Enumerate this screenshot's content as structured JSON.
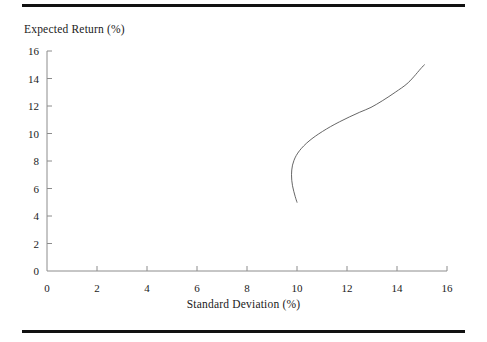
{
  "figure": {
    "background": "#ffffff",
    "rule_color": "#111111",
    "axis_color": "#8c8c8c",
    "curve_color": "#555555"
  },
  "chart_data": {
    "type": "line",
    "title": "",
    "xlabel": "Standard Deviation (%)",
    "ylabel": "Expected Return (%)",
    "xlim": [
      0,
      16
    ],
    "ylim": [
      0,
      16
    ],
    "xticks": [
      0,
      2,
      4,
      6,
      8,
      10,
      12,
      14,
      16
    ],
    "yticks": [
      0,
      2,
      4,
      6,
      8,
      10,
      12,
      14,
      16
    ],
    "xtick_labels": [
      "0",
      "2",
      "4",
      "6",
      "8",
      "10",
      "12",
      "14",
      "16"
    ],
    "ytick_labels": [
      "0",
      "2",
      "4",
      "6",
      "8",
      "10",
      "12",
      "14",
      "16"
    ],
    "grid": false,
    "legend": null,
    "series": [
      {
        "name": "Efficient frontier",
        "color": "#555555",
        "line_width": 0.9,
        "x": [
          10.0,
          9.93,
          9.87,
          9.82,
          9.79,
          9.78,
          9.79,
          9.82,
          9.88,
          9.97,
          10.1,
          10.27,
          10.48,
          10.73,
          11.02,
          11.34,
          11.7,
          12.09,
          12.51,
          12.96,
          13.43,
          13.93,
          14.45,
          14.99,
          15.1
        ],
        "y": [
          5.0,
          5.4,
          5.8,
          6.2,
          6.6,
          7.0,
          7.35,
          7.7,
          8.05,
          8.4,
          8.75,
          9.1,
          9.45,
          9.8,
          10.15,
          10.5,
          10.85,
          11.2,
          11.55,
          11.9,
          12.4,
          13.0,
          13.7,
          14.8,
          15.0
        ],
        "annotations": {
          "lower_endpoint": [
            10.0,
            5.0
          ],
          "minimum_variance_point": [
            9.78,
            7.0
          ],
          "upper_endpoint": [
            15.1,
            15.0
          ]
        }
      }
    ]
  },
  "axes": {
    "x_title": "Standard Deviation (%)",
    "y_title": "Expected Return (%)"
  }
}
